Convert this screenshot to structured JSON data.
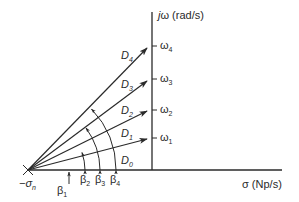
{
  "diagram": {
    "type": "s-plane pole-zero vector diagram",
    "axes": {
      "vertical_label_j": "j",
      "vertical_label_omega": "ω",
      "vertical_label_units": " (rad/s)",
      "horizontal_label_sigma": "σ",
      "horizontal_label_units": " (Np/s)"
    },
    "origin_point": {
      "label_main": "−σ",
      "label_sub": "n",
      "marker": "cross"
    },
    "frequency_ticks": [
      {
        "main": "ω",
        "sub": "4"
      },
      {
        "main": "ω",
        "sub": "3"
      },
      {
        "main": "ω",
        "sub": "2"
      },
      {
        "main": "ω",
        "sub": "1"
      }
    ],
    "vectors": [
      {
        "main": "D",
        "sub": "4"
      },
      {
        "main": "D",
        "sub": "3"
      },
      {
        "main": "D",
        "sub": "2"
      },
      {
        "main": "D",
        "sub": "1"
      },
      {
        "main": "D",
        "sub": "0"
      }
    ],
    "angles": [
      {
        "main": "β",
        "sub": "1"
      },
      {
        "main": "β",
        "sub": "2"
      },
      {
        "main": "β",
        "sub": "3"
      },
      {
        "main": "β",
        "sub": "4"
      }
    ],
    "colors": {
      "line": "#2a2a2a",
      "background": "#ffffff"
    }
  }
}
